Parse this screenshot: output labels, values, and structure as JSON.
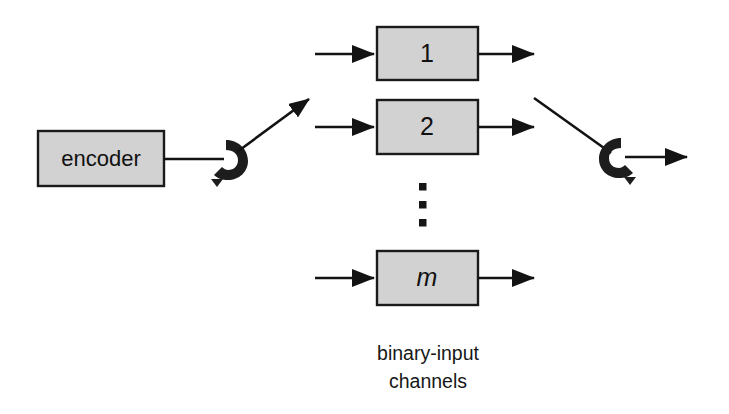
{
  "figure": {
    "background_color": "#ffffff",
    "line_color": "#131313",
    "box_fill_color": "#d2d2d2",
    "box_border_color": "#1a1a1a",
    "switch_color": "#1d1d1d"
  },
  "encoder": {
    "label": "encoder"
  },
  "channels": [
    {
      "label": "1",
      "italic": false
    },
    {
      "label": "2",
      "italic": false
    },
    {
      "label": "m",
      "italic": true
    }
  ],
  "ellipsis": {
    "dots": [
      "▪",
      "▪",
      "▪"
    ]
  },
  "caption": {
    "line1": "binary-input",
    "line2": "channels"
  },
  "switches": {
    "input_switch_name": "rotary-switch",
    "output_switch_name": "rotary-switch"
  }
}
